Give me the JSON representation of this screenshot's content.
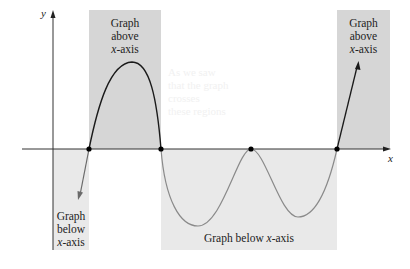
{
  "axes": {
    "x_label": "x",
    "y_label": "y"
  },
  "regions": [
    {
      "id": "above-left",
      "line1": "Graph",
      "line2": "above",
      "line3_italic": "x",
      "line3_rest": "-axis"
    },
    {
      "id": "above-right",
      "line1": "Graph",
      "line2": "above",
      "line3_italic": "x",
      "line3_rest": "-axis"
    },
    {
      "id": "below-left",
      "line1": "Graph",
      "line2": "below",
      "line3_italic": "x",
      "line3_rest": "-axis"
    },
    {
      "id": "below-middle",
      "text_prefix": "Graph below ",
      "text_italic": "x",
      "text_suffix": "-axis"
    }
  ],
  "colors": {
    "above_shade": "#d6d6d6",
    "below_shade": "#e9e9e9",
    "curve_above": "#1a1a1a",
    "curve_below": "#8a8a8a",
    "axis": "#333333"
  },
  "zeros": [
    "x1",
    "x2",
    "x3",
    "x4"
  ],
  "ghost_text": [
    "As we saw",
    "that the graph",
    "crosses",
    "these regions"
  ]
}
